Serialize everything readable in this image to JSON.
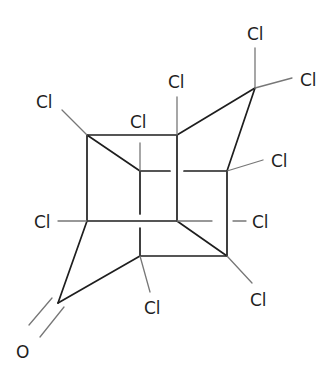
{
  "diagram": {
    "type": "chemical-structure",
    "name_hint": "chlordecone-like cage ketone",
    "atoms": [
      {
        "id": "A",
        "element": "C",
        "x": 87,
        "y": 135
      },
      {
        "id": "B",
        "element": "C",
        "x": 177,
        "y": 135
      },
      {
        "id": "D",
        "element": "C",
        "x": 140,
        "y": 171
      },
      {
        "id": "C",
        "element": "C",
        "x": 227,
        "y": 171
      },
      {
        "id": "E",
        "element": "C",
        "x": 87,
        "y": 221
      },
      {
        "id": "F",
        "element": "C",
        "x": 177,
        "y": 221
      },
      {
        "id": "H",
        "element": "C",
        "x": 140,
        "y": 256
      },
      {
        "id": "G",
        "element": "C",
        "x": 227,
        "y": 256
      },
      {
        "id": "K",
        "element": "C",
        "x": 255,
        "y": 88
      },
      {
        "id": "Q",
        "element": "C",
        "x": 58,
        "y": 303
      }
    ],
    "labels": [
      {
        "id": "cl-a",
        "text": "Cl",
        "x": 36,
        "y": 108
      },
      {
        "id": "cl-d",
        "text": "Cl",
        "x": 130,
        "y": 128
      },
      {
        "id": "cl-b",
        "text": "Cl",
        "x": 168,
        "y": 88
      },
      {
        "id": "cl-k1",
        "text": "Cl",
        "x": 247,
        "y": 40
      },
      {
        "id": "cl-k2",
        "text": "Cl",
        "x": 300,
        "y": 86
      },
      {
        "id": "cl-c",
        "text": "Cl",
        "x": 271,
        "y": 167
      },
      {
        "id": "cl-e",
        "text": "Cl",
        "x": 34,
        "y": 228
      },
      {
        "id": "cl-f",
        "text": "Cl",
        "x": 252,
        "y": 228
      },
      {
        "id": "cl-h",
        "text": "Cl",
        "x": 144,
        "y": 314
      },
      {
        "id": "cl-g",
        "text": "Cl",
        "x": 250,
        "y": 306
      },
      {
        "id": "o",
        "text": "O",
        "x": 16,
        "y": 358
      }
    ]
  }
}
